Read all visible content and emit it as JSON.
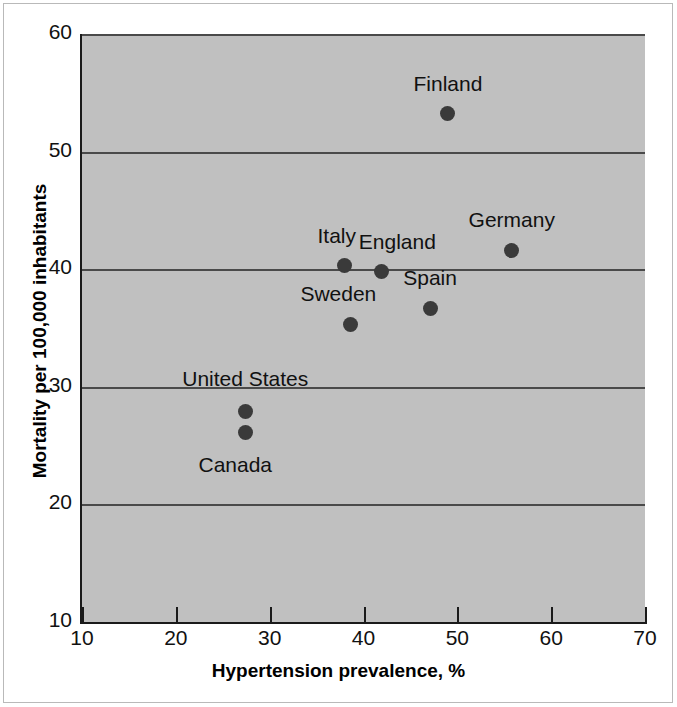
{
  "chart_data": {
    "type": "scatter",
    "title": "",
    "xlabel": "Hypertension prevalence, %",
    "ylabel": "Mortality per 100,000 inhabitants",
    "xlim": [
      10,
      70
    ],
    "ylim": [
      10,
      60
    ],
    "xticks": [
      "10",
      "20",
      "30",
      "40",
      "50",
      "60",
      "70"
    ],
    "yticks": [
      "10",
      "20",
      "30",
      "40",
      "50",
      "60"
    ],
    "gridlines": {
      "horizontal": [
        "20",
        "30",
        "40",
        "50",
        "60"
      ],
      "vertical": []
    },
    "legend": "none",
    "points": [
      {
        "label": "Finland",
        "x": 49.0,
        "y": 53.2,
        "label_dx": 0,
        "label_dy": -30
      },
      {
        "label": "Germany",
        "x": 55.8,
        "y": 41.6,
        "label_dx": 0,
        "label_dy": -30
      },
      {
        "label": "Italy",
        "x": 38.0,
        "y": 40.3,
        "label_dx": -8,
        "label_dy": -30
      },
      {
        "label": "England",
        "x": 41.9,
        "y": 39.8,
        "label_dx": 16,
        "label_dy": -30
      },
      {
        "label": "Spain",
        "x": 47.1,
        "y": 36.7,
        "label_dx": 0,
        "label_dy": -30
      },
      {
        "label": "Sweden",
        "x": 38.6,
        "y": 35.3,
        "label_dx": -12,
        "label_dy": -30
      },
      {
        "label": "United States",
        "x": 27.4,
        "y": 27.9,
        "label_dx": 0,
        "label_dy": -32
      },
      {
        "label": "Canada",
        "x": 27.4,
        "y": 26.1,
        "label_dx": -10,
        "label_dy": 32
      }
    ]
  },
  "style": {
    "plot_background": "#c0c0c0",
    "point_color": "#3a3a3a",
    "gridline_color": "#4a4a4a",
    "axis_color": "#1a1a1a",
    "figure_background": "#ffffff"
  }
}
